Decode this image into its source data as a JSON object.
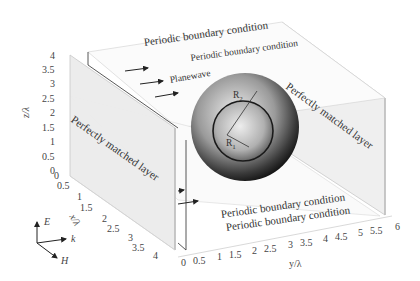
{
  "diagram": {
    "labels": {
      "pbc_top_1": "Periodic boundary condition",
      "pbc_top_2": "Periodic boundary condition",
      "pbc_bottom_1": "Periodic boundary condition",
      "pbc_bottom_2": "Periodic boundary condition",
      "pml_left": "Perfectly matched layer",
      "pml_right": "Perfectly matched layer",
      "planewave": "Planewave",
      "r_outer": "R",
      "r_outer_sub": "2",
      "r_inner": "R",
      "r_inner_sub": "1"
    },
    "axes": {
      "z_label": "z/λ",
      "x_label": "x/λ",
      "y_label": "y/λ",
      "z_ticks": [
        "4",
        "3.5",
        "3",
        "2.5",
        "2",
        "1.5",
        "1",
        "0.5",
        "0"
      ],
      "x_ticks": [
        "0",
        "0.5",
        "1",
        "1.5",
        "2",
        "2.5",
        "3",
        "3.5",
        "4"
      ],
      "y_ticks": [
        "0",
        "0.5",
        "1",
        "1.5",
        "2",
        "2.5",
        "3",
        "3.5",
        "4",
        "4.5",
        "5",
        "5.5",
        "6"
      ]
    },
    "field_legend": {
      "e_label": "E",
      "k_label": "k",
      "h_label": "H"
    },
    "colors": {
      "pml_panel": "#ececec",
      "pbc_panel": "#f7f7f7",
      "edge": "#555555",
      "sphere_dark": "#1a1a1a",
      "sphere_light": "#e6e6e6"
    }
  }
}
